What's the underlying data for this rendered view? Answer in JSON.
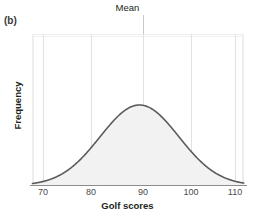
{
  "figure": {
    "panel_label": "(b)",
    "title": "Mean",
    "background_color": "#ffffff"
  },
  "chart_data": {
    "type": "area",
    "title": "Mean",
    "xlabel": "Golf scores",
    "ylabel": "Frequency",
    "xlim": [
      70,
      110
    ],
    "ylim": [
      0,
      1
    ],
    "xticks": [
      70,
      80,
      90,
      100,
      110
    ],
    "xtick_labels": [
      "70",
      "80",
      "90",
      "100",
      "110"
    ],
    "yticks": [],
    "ytick_labels": [],
    "grid": true,
    "grid_orientation": "vertical",
    "legend": null,
    "distribution": {
      "shape": "normal",
      "mean": 90,
      "std": 8.2,
      "peak_value": 1.0
    },
    "annotations": [
      {
        "label": "Mean",
        "x": 90,
        "position": "above-axis"
      }
    ],
    "x": [
      70,
      72,
      74,
      76,
      78,
      80,
      82,
      84,
      86,
      88,
      90,
      92,
      94,
      96,
      98,
      100,
      102,
      104,
      106,
      108,
      110
    ],
    "y": [
      0.026,
      0.049,
      0.086,
      0.141,
      0.216,
      0.312,
      0.423,
      0.54,
      0.653,
      0.748,
      0.815,
      0.847,
      0.841,
      0.799,
      0.726,
      0.631,
      0.524,
      0.415,
      0.313,
      0.224,
      0.152
    ],
    "series": [
      {
        "name": "Golf score distribution",
        "stroke_color": "#5b5b5b",
        "fill_color": "#f2f2f2",
        "values": [
          0.026,
          0.049,
          0.086,
          0.141,
          0.216,
          0.312,
          0.423,
          0.54,
          0.653,
          0.748,
          0.815,
          0.847,
          0.841,
          0.799,
          0.726,
          0.631,
          0.524,
          0.415,
          0.313,
          0.224,
          0.152
        ]
      }
    ],
    "colors": {
      "curve_stroke": "#5b5b5b",
      "curve_fill": "#f2f2f2",
      "gridline": "#e2e2e2",
      "frame": "#dcdcdc",
      "axis": "#8c8c8c",
      "text": "#231f20"
    }
  }
}
